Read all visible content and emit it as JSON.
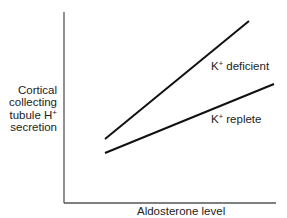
{
  "chart_data": {
    "type": "line",
    "title": "",
    "xlabel": "Aldosterone level",
    "ylabel": "Cortical collecting tubule H+ secretion",
    "ylabel_lines": [
      "Cortical",
      "collecting",
      "tubule H",
      "secretion"
    ],
    "ylabel_superscript": "+",
    "grid": false,
    "legend": "inline labels",
    "axis_ticks": "none",
    "x": [
      0.2,
      1.0
    ],
    "series": [
      {
        "name": "K+ deficient",
        "label_base": "K",
        "label_sup": "+",
        "label_rest": " deficient",
        "values": [
          0.34,
          0.96
        ],
        "pixel_points": [
          [
            105,
            139
          ],
          [
            249,
            21
          ]
        ]
      },
      {
        "name": "K+ replete",
        "label_base": "K",
        "label_sup": "+",
        "label_rest": " replete",
        "values": [
          0.26,
          0.62
        ],
        "pixel_points": [
          [
            105,
            153
          ],
          [
            274,
            84
          ]
        ]
      }
    ],
    "axes_pixels": {
      "origin": [
        64,
        203
      ],
      "y_top": [
        64,
        12
      ],
      "x_end": [
        276,
        203
      ]
    },
    "colors": {
      "lines": "#111111",
      "axes": "#555555",
      "text": "#222222",
      "background": "#ffffff"
    }
  }
}
